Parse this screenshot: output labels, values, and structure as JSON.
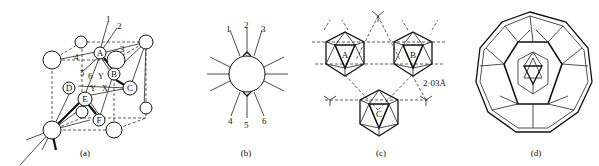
{
  "figure": {
    "panels": [
      {
        "id": "a",
        "caption": "(a)",
        "description": "Cubic cell with icosahedral cluster of atoms A-F",
        "atom_labels": [
          "A",
          "B",
          "C",
          "D",
          "E",
          "F"
        ],
        "bond_labels": [
          "1",
          "2",
          "3",
          "4",
          "5",
          "6"
        ],
        "axis_labels": [
          "Y",
          "X",
          "Y"
        ]
      },
      {
        "id": "b",
        "caption": "(b)",
        "description": "Central atom with twelve bonds",
        "bond_labels": [
          "1",
          "2",
          "3",
          "4",
          "5",
          "6"
        ]
      },
      {
        "id": "c",
        "caption": "(c)",
        "description": "Three icosahedra linked by dashed lines",
        "icosahedron_labels": [
          "A",
          "B",
          "C"
        ],
        "distance_label": "2·03Å"
      },
      {
        "id": "d",
        "caption": "(d)",
        "description": "Nested polyhedral shell with inner icosahedron"
      }
    ]
  }
}
